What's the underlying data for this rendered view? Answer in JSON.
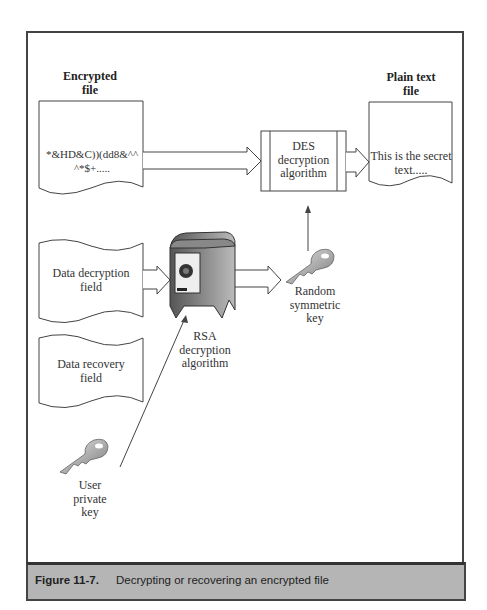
{
  "diagram": {
    "encrypted_file": {
      "title_line1": "Encrypted",
      "title_line2": "file",
      "content_line1": "*&HD&C))(dd8&^^",
      "content_line2": "^*$+....."
    },
    "plain_file": {
      "title_line1": "Plain text",
      "title_line2": "file",
      "content_line1": "This is the secret",
      "content_line2": "text....."
    },
    "des": {
      "line1": "DES",
      "line2": "decryption",
      "line3": "algorithm"
    },
    "ddf": {
      "line1": "Data decryption",
      "line2": "field"
    },
    "drf": {
      "line1": "Data recovery",
      "line2": "field"
    },
    "rsa": {
      "line1": "RSA",
      "line2": "decryption",
      "line3": "algorithm"
    },
    "random_key": {
      "line1": "Random",
      "line2": "symmetric",
      "line3": "key"
    },
    "user_key": {
      "line1": "User",
      "line2": "private",
      "line3": "key"
    }
  },
  "caption": {
    "number": "Figure 11-7.",
    "text": "Decrypting or recovering an encrypted file"
  },
  "colors": {
    "frame": "#444444",
    "caption_bg": "#b5b5b5"
  }
}
